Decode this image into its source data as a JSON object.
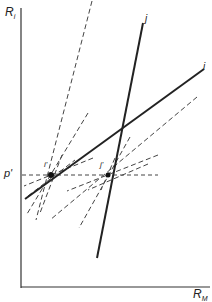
{
  "diagram": {
    "y_axis_label": "R",
    "y_axis_sub": "i",
    "x_axis_label": "R",
    "x_axis_sub": "M",
    "price_label": "p'",
    "line_i_label": "i",
    "line_j_label": "j",
    "point_left_label": "i'",
    "point_right_label": "j'",
    "colors": {
      "ink": "#222222",
      "dash": "#444444",
      "background": "#ffffff"
    }
  }
}
